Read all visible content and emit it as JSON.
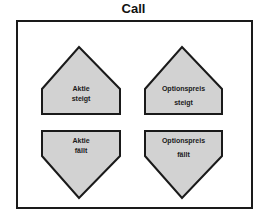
{
  "title": "Call",
  "colors": {
    "fill": "#d2d2d2",
    "stroke": "#1a1a1a",
    "frame": "#1a1a1a"
  },
  "shapes": [
    {
      "id": "stock-up",
      "direction": "up",
      "line1": "Aktie",
      "line2": "steigt"
    },
    {
      "id": "option-up",
      "direction": "up",
      "line1": "Optionspreis",
      "line2": "steigt"
    },
    {
      "id": "stock-down",
      "direction": "down",
      "line1": "Aktie",
      "line2": "fällt"
    },
    {
      "id": "option-down",
      "direction": "down",
      "line1": "Optionspreis",
      "line2": "fällt"
    }
  ]
}
